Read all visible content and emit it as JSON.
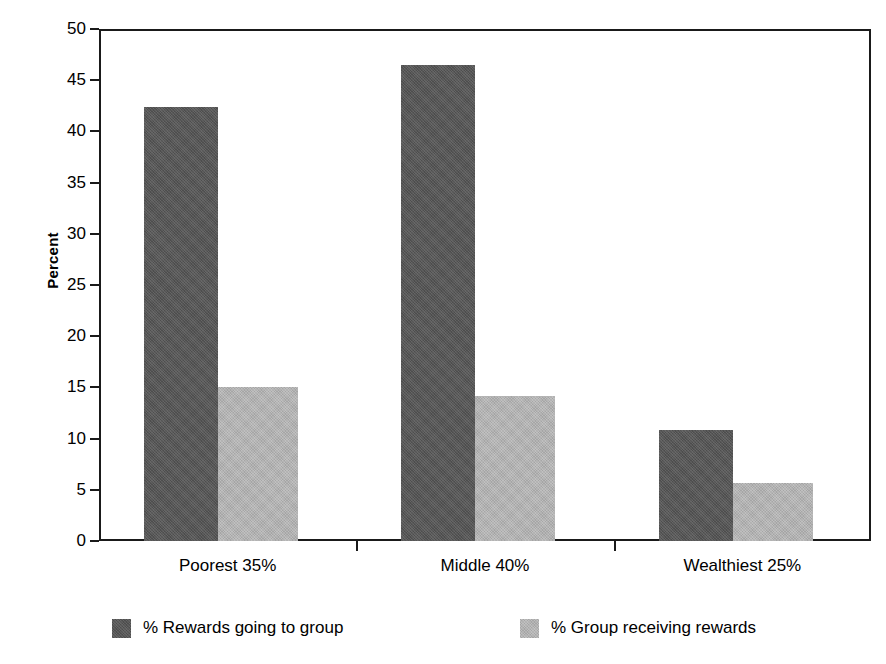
{
  "chart_data": {
    "type": "bar",
    "title": "",
    "xlabel": "",
    "ylabel": "Percent",
    "ylim": [
      0,
      50
    ],
    "ytick_step": 5,
    "yticks": [
      "50",
      "45",
      "40",
      "35",
      "30",
      "25",
      "20",
      "15",
      "10",
      "5",
      "0"
    ],
    "grid": true,
    "legend_position": "bottom",
    "categories": [
      "Poorest 35%",
      "Middle 40%",
      "Wealthiest 25%"
    ],
    "series": [
      {
        "name": "% Rewards going to group",
        "color": "#565656",
        "values": [
          42.4,
          46.5,
          10.8
        ]
      },
      {
        "name": "% Group receiving rewards",
        "color": "#b2b2b2",
        "values": [
          15.0,
          14.2,
          5.7
        ]
      }
    ]
  },
  "axis": {
    "y_title": "Percent"
  },
  "legend": {
    "items": [
      {
        "label": "% Rewards going to group"
      },
      {
        "label": "% Group receiving rewards"
      }
    ]
  }
}
